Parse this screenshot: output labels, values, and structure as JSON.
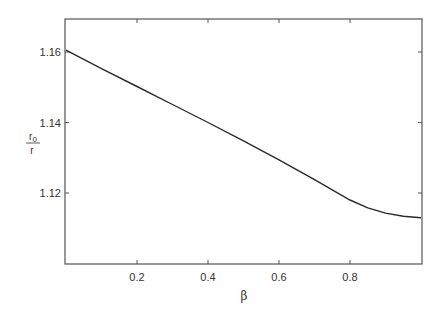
{
  "chart_data": {
    "type": "line",
    "title": "",
    "xlabel": "β",
    "ylabel": {
      "numerator": "r0",
      "numerator_base": "r",
      "numerator_sub": "0",
      "denominator": "r"
    },
    "xlim": [
      0,
      1
    ],
    "ylim": [
      1.1,
      1.17
    ],
    "xticks": [
      0.2,
      0.4,
      0.6,
      0.8
    ],
    "xtick_labels": [
      "0.2",
      "0.4",
      "0.6",
      "0.8"
    ],
    "yticks": [
      1.12,
      1.14,
      1.16
    ],
    "ytick_labels": [
      "1.12",
      "1.14",
      "1.16"
    ],
    "grid": false,
    "legend": null,
    "series": [
      {
        "name": "r0/r",
        "x": [
          0.0,
          0.1,
          0.2,
          0.3,
          0.4,
          0.5,
          0.6,
          0.7,
          0.8,
          0.85,
          0.9,
          0.95,
          1.0
        ],
        "y": [
          1.1605,
          1.1553,
          1.1502,
          1.1451,
          1.14,
          1.1348,
          1.1294,
          1.1238,
          1.118,
          1.1158,
          1.1143,
          1.1134,
          1.113
        ]
      }
    ]
  },
  "plot": {
    "frame_color": "#555555",
    "line_color": "#2a2a2a"
  }
}
